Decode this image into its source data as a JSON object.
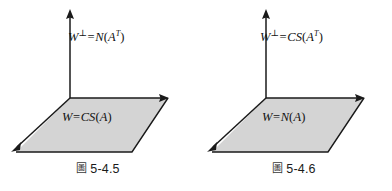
{
  "page": {
    "background_color": "#ffffff",
    "width": 392,
    "height": 191
  },
  "style": {
    "plane_fill_color": "#d4d4d4",
    "line_color": "#1a1a1a",
    "text_color": "#111111"
  },
  "figures": [
    {
      "id": "figure-5-4-5",
      "caption_glyph": "圖",
      "caption_number": "5-4.5",
      "vertical_axis_label": {
        "subspace": "W",
        "superscript": "⊥",
        "equals": "=",
        "operator": "N",
        "open_paren": "(",
        "argument": "A",
        "argument_superscript": "T",
        "close_paren": ")",
        "full_text": "W⊥ = N(Aᵀ)"
      },
      "plane_label": {
        "subspace": "W",
        "equals": "=",
        "operator": "CS",
        "open_paren": "(",
        "argument": "A",
        "close_paren": ")",
        "full_text": "W = CS(A)"
      }
    },
    {
      "id": "figure-5-4-6",
      "caption_glyph": "圖",
      "caption_number": "5-4.6",
      "vertical_axis_label": {
        "subspace": "W",
        "superscript": "⊥",
        "equals": "=",
        "operator": "CS",
        "open_paren": "(",
        "argument": "A",
        "argument_superscript": "T",
        "close_paren": ")",
        "full_text": "W⊥ = CS(Aᵀ)"
      },
      "plane_label": {
        "subspace": "W",
        "equals": "=",
        "operator": "N",
        "open_paren": "(",
        "argument": "A",
        "close_paren": ")",
        "full_text": "W = N(A)"
      }
    }
  ]
}
